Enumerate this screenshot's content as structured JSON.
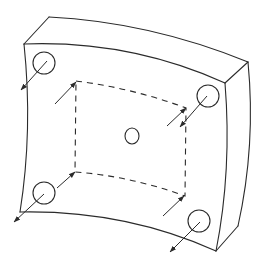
{
  "figure": {
    "title": "",
    "colors": {
      "line": "#2b2b2b",
      "background": "#ffffff"
    },
    "plate": {
      "back_top_left": [
        49,
        17
      ],
      "back_top_right": [
        248,
        62
      ],
      "front_top_left": [
        24,
        44
      ],
      "front_top_right": [
        225,
        83
      ],
      "front_bottom_right": [
        216,
        251
      ],
      "front_bottom_left": [
        20,
        212
      ],
      "side_bottom_right": [
        238,
        226
      ]
    },
    "holes": [
      {
        "name": "top-left",
        "cx": 44,
        "cy": 63,
        "r": 11
      },
      {
        "name": "top-right",
        "cx": 208,
        "cy": 96,
        "r": 11
      },
      {
        "name": "bottom-left",
        "cx": 44,
        "cy": 193,
        "r": 11
      },
      {
        "name": "bottom-right",
        "cx": 199,
        "cy": 221,
        "r": 11
      },
      {
        "name": "center",
        "cx": 132,
        "cy": 136,
        "rx": 7,
        "ry": 8
      }
    ],
    "dashed_square": [
      [
        76,
        81
      ],
      [
        186,
        108
      ],
      [
        185,
        196
      ],
      [
        75,
        172
      ]
    ],
    "arrows": [
      {
        "name": "top-left-outward",
        "from": [
          47,
          61
        ],
        "to": [
          21,
          90
        ]
      },
      {
        "name": "top-left-inward",
        "from": [
          55,
          104
        ],
        "to": [
          76,
          82
        ]
      },
      {
        "name": "top-right-outward",
        "from": [
          207,
          96
        ],
        "to": [
          180,
          127
        ]
      },
      {
        "name": "top-right-inward",
        "from": [
          167,
          126
        ],
        "to": [
          186,
          108
        ]
      },
      {
        "name": "bottom-left-outward",
        "from": [
          44,
          194
        ],
        "to": [
          14,
          222
        ]
      },
      {
        "name": "bottom-left-inward",
        "from": [
          57,
          188
        ],
        "to": [
          75,
          172
        ]
      },
      {
        "name": "bottom-right-outward",
        "from": [
          200,
          222
        ],
        "to": [
          170,
          252
        ]
      },
      {
        "name": "bottom-right-inward",
        "from": [
          163,
          216
        ],
        "to": [
          184,
          196
        ]
      }
    ]
  }
}
